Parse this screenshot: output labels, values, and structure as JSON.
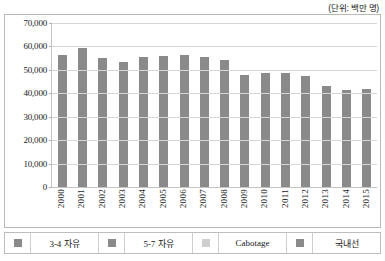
{
  "unit_note": "(단위: 백만 명)",
  "legend": {
    "items": [
      {
        "label": "3-4 자유",
        "color": "#8a8a8a",
        "swatch_name": "legend-swatch-freedom-3-4"
      },
      {
        "label": "5-7 자유",
        "color": "#8a8a8a",
        "swatch_name": "legend-swatch-freedom-5-7"
      },
      {
        "label": "Cabotage",
        "color": "#cfcfcf",
        "swatch_name": "legend-swatch-cabotage"
      },
      {
        "label": "국내선",
        "color": "#8a8a8a",
        "swatch_name": "legend-swatch-domestic"
      }
    ]
  },
  "chart_data": {
    "type": "bar",
    "title": "",
    "subtitle": "",
    "xlabel": "",
    "ylabel": "",
    "unit": "(단위: 백만 명)",
    "ylim": [
      0,
      70000
    ],
    "ytick_labels": [
      "70,000",
      "60,000",
      "50,000",
      "40,000",
      "30,000",
      "20,000",
      "10,000",
      "0"
    ],
    "ytick_values": [
      70000,
      60000,
      50000,
      40000,
      30000,
      20000,
      10000,
      0
    ],
    "grid": true,
    "legend_position": "bottom",
    "bar_color": "#8a8a8a",
    "categories": [
      "2000",
      "2001",
      "2002",
      "2003",
      "2004",
      "2005",
      "2006",
      "2007",
      "2008",
      "2009",
      "2010",
      "2011",
      "2012",
      "2013",
      "2014",
      "2015"
    ],
    "series": [
      {
        "name": "3-4 자유",
        "values": [
          56500,
          59500,
          55000,
          53500,
          55500,
          56000,
          56500,
          55500,
          54000,
          48000,
          48500,
          48500,
          47500,
          43000,
          41500,
          41800
        ]
      }
    ]
  }
}
